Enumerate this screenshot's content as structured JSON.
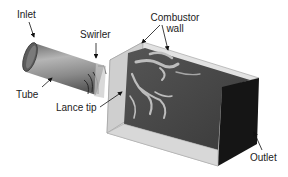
{
  "figure": {
    "type": "3d-schematic",
    "labels": {
      "inlet": "Inlet",
      "swirler": "Swirler",
      "combustor_wall_line1": "Combustor",
      "combustor_wall_line2": "wall",
      "tube": "Tube",
      "lance_tip": "Lance tip",
      "outlet": "Outlet"
    },
    "colors": {
      "background": "#ffffff",
      "wall_light": "#d6d6d6",
      "wall_top": "#e4e4e4",
      "interior_dark": "#4a4a4a",
      "flame_light": "#b8b8b8",
      "outlet_face": "#151515",
      "tube_body": "#9a9a9a",
      "tube_dark": "#5a5a5a",
      "text": "#222222"
    }
  }
}
